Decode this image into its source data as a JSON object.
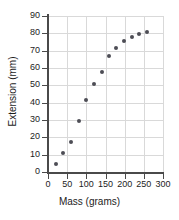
{
  "chart_data": {
    "type": "scatter",
    "title": "",
    "xlabel": "Mass (grams)",
    "ylabel": "Extension (mm)",
    "xlim": [
      0,
      300
    ],
    "ylim": [
      0,
      90
    ],
    "xticks": [
      0,
      50,
      100,
      150,
      200,
      250,
      300
    ],
    "yticks": [
      0,
      10,
      20,
      30,
      40,
      50,
      60,
      70,
      80,
      90
    ],
    "xtick_labels": [
      "0",
      "50",
      "100",
      "150",
      "200",
      "250",
      "300"
    ],
    "ytick_labels": [
      "0",
      "10",
      "20",
      "30",
      "40",
      "50",
      "60",
      "70",
      "80",
      "90"
    ],
    "grid": true,
    "legend": false,
    "marker_color": "#4d4d55",
    "grid_color": "#d9d9d9",
    "axis_color": "#4a4a4a",
    "x": [
      20,
      40,
      60,
      80,
      100,
      120,
      140,
      158,
      178,
      198,
      218,
      238,
      258
    ],
    "y": [
      4.5,
      11.2,
      17.5,
      29.5,
      41.5,
      50.7,
      57.6,
      66.8,
      71.6,
      75.8,
      77.8,
      79.8,
      80.8
    ],
    "points": [
      {
        "x": 20,
        "y": 4.5
      },
      {
        "x": 40,
        "y": 11.2
      },
      {
        "x": 60,
        "y": 17.5
      },
      {
        "x": 80,
        "y": 29.5
      },
      {
        "x": 100,
        "y": 41.5
      },
      {
        "x": 120,
        "y": 50.7
      },
      {
        "x": 140,
        "y": 57.6
      },
      {
        "x": 158,
        "y": 66.8
      },
      {
        "x": 178,
        "y": 71.6
      },
      {
        "x": 198,
        "y": 75.8
      },
      {
        "x": 218,
        "y": 77.8
      },
      {
        "x": 238,
        "y": 79.8
      },
      {
        "x": 258,
        "y": 80.8
      }
    ]
  }
}
